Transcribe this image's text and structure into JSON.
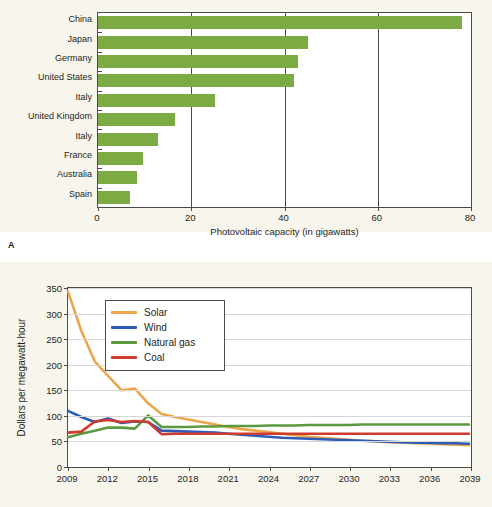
{
  "panels": {
    "a_label": "A"
  },
  "chart_data": [
    {
      "type": "bar",
      "orientation": "horizontal",
      "title": "",
      "xlabel": "Photovoltaic capacity (in gigawatts)",
      "ylabel": "",
      "xlim": [
        0,
        80
      ],
      "xticks": [
        0,
        20,
        40,
        60,
        80
      ],
      "xtick_labels": [
        "0",
        "20",
        "40",
        "60",
        "80"
      ],
      "grid": "vertical",
      "legend": "none",
      "bar_color": "#7cab44",
      "categories": [
        "China",
        "Japan",
        "Germany",
        "United States",
        "Italy",
        "United Kingdom",
        "Italy",
        "France",
        "Australia",
        "Spain"
      ],
      "values": [
        78.1,
        45.0,
        42.9,
        42.0,
        25.0,
        16.5,
        12.8,
        9.6,
        8.3,
        6.8
      ]
    },
    {
      "type": "line",
      "title": "",
      "xlabel": "",
      "ylabel": "Dollars per megawatt-hour",
      "ylim": [
        0,
        350
      ],
      "yticks": [
        0,
        50,
        100,
        150,
        200,
        250,
        300,
        350
      ],
      "ytick_labels": [
        "0",
        "50",
        "100",
        "150",
        "200",
        "250",
        "300",
        "350"
      ],
      "xlim": [
        2009,
        2039
      ],
      "xticks": [
        2009,
        2012,
        2015,
        2018,
        2021,
        2024,
        2027,
        2030,
        2033,
        2036,
        2039
      ],
      "xtick_labels": [
        "2009",
        "2012",
        "2015",
        "2018",
        "2021",
        "2024",
        "2027",
        "2030",
        "2033",
        "2036",
        "2039"
      ],
      "grid": "horizontal",
      "legend_position": "upper-left-inside",
      "x": [
        2009,
        2010,
        2011,
        2012,
        2013,
        2014,
        2015,
        2016,
        2017,
        2018,
        2019,
        2020,
        2021,
        2022,
        2023,
        2024,
        2025,
        2026,
        2027,
        2028,
        2029,
        2030,
        2031,
        2032,
        2033,
        2034,
        2035,
        2036,
        2037,
        2038,
        2039
      ],
      "series": [
        {
          "name": "Solar",
          "color": "#eda54a",
          "values": [
            343,
            265,
            205,
            176,
            148,
            151,
            122,
            101,
            95,
            90,
            85,
            80,
            75,
            71,
            68,
            65,
            62,
            59,
            56,
            54,
            52,
            50,
            48,
            47,
            45,
            44,
            43,
            42,
            41,
            40,
            39
          ]
        },
        {
          "name": "Wind",
          "color": "#2a5cb8",
          "values": [
            107,
            95,
            85,
            92,
            83,
            86,
            85,
            68,
            67,
            66,
            65,
            64,
            62,
            60,
            58,
            56,
            54,
            53,
            52,
            51,
            50,
            49,
            48,
            47,
            46,
            45,
            44,
            44,
            43,
            43,
            42
          ]
        },
        {
          "name": "Natural gas",
          "color": "#5c9a3f",
          "values": [
            55,
            62,
            68,
            74,
            74,
            72,
            98,
            75,
            75,
            75,
            76,
            76,
            77,
            77,
            77,
            78,
            78,
            78,
            79,
            79,
            79,
            79,
            80,
            80,
            80,
            80,
            80,
            80,
            80,
            80,
            80
          ]
        },
        {
          "name": "Coal",
          "color": "#cf3b2c",
          "values": [
            64,
            66,
            86,
            89,
            85,
            87,
            85,
            61,
            62,
            62,
            62,
            62,
            62,
            62,
            62,
            62,
            62,
            62,
            62,
            62,
            62,
            62,
            62,
            62,
            62,
            62,
            62,
            62,
            62,
            62,
            62
          ]
        }
      ]
    }
  ]
}
